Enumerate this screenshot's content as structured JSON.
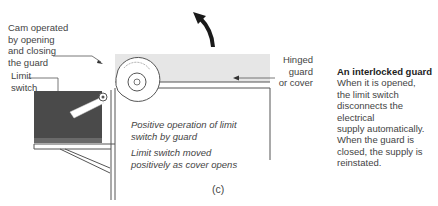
{
  "figure": {
    "panel_label": "(c)",
    "labels": {
      "cam": [
        "Cam operated",
        "by opening",
        "and closing",
        "the guard"
      ],
      "limit_switch": [
        "Limit",
        "switch"
      ],
      "hinged_guard": [
        "Hinged",
        "guard",
        "or cover"
      ],
      "positive_operation": [
        "Positive operation of limit",
        "switch by guard"
      ],
      "switch_moved": [
        "Limit switch moved",
        "positively as cover opens"
      ]
    },
    "caption": {
      "title": "An interlocked guard",
      "body": [
        "When it is opened,",
        "the limit switch",
        "disconnects the electrical",
        "supply automatically.",
        "When the guard is",
        "closed, the supply is",
        "reinstated."
      ]
    },
    "colors": {
      "line": "#555555",
      "guard_fill": "#e6e6e6",
      "switch_box": "#4a4a4a",
      "arrow": "#1a1a1a"
    }
  }
}
